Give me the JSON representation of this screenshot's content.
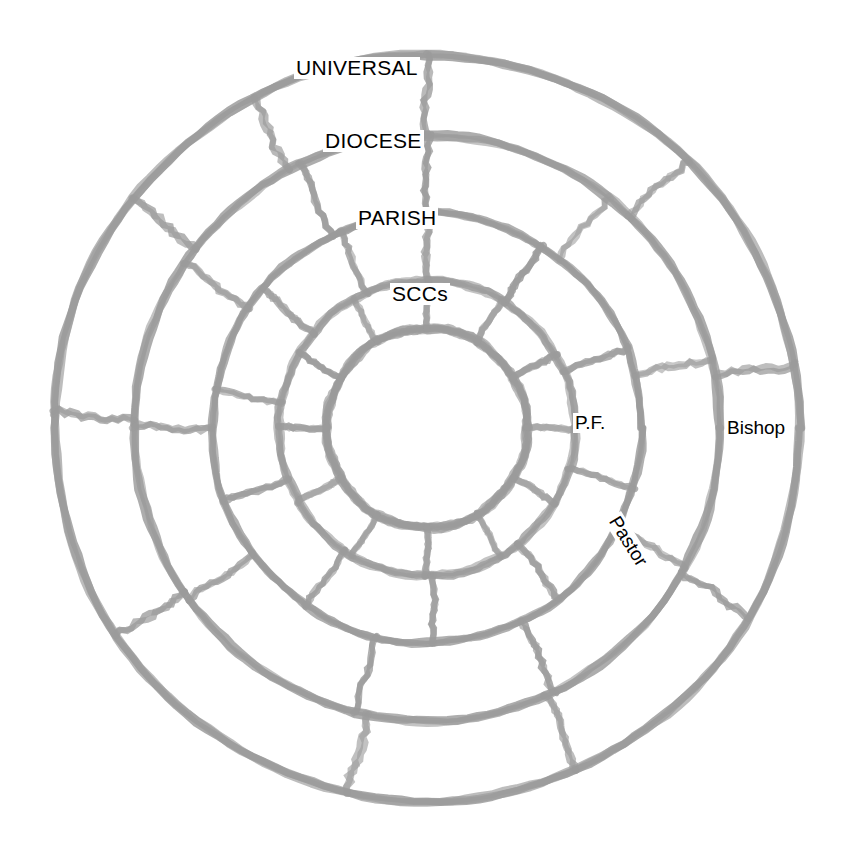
{
  "diagram": {
    "type": "concentric-ring-diagram",
    "center": {
      "x": 427,
      "y": 428
    },
    "stroke_color": "#9b9b9b",
    "text_color": "#000000",
    "background_color": "#ffffff",
    "rings": [
      {
        "id": "universal",
        "label": "UNIVERSAL",
        "level": 1,
        "outer_radius": 373,
        "inner_radius": 293,
        "segment_count": 10,
        "spoke_angles_deg": [
          90,
          46,
          10,
          330,
          294,
          258,
          214,
          178,
          142,
          118
        ]
      },
      {
        "id": "diocese",
        "label": "DIOCESE",
        "level": 2,
        "outer_radius": 293,
        "inner_radius": 215,
        "segment_count": 10,
        "spoke_angles_deg": [
          90,
          52,
          14,
          332,
          296,
          256,
          216,
          180,
          146,
          116
        ]
      },
      {
        "id": "parish",
        "label": "PARISH",
        "level": 3,
        "outer_radius": 215,
        "inner_radius": 148,
        "segment_count": 11,
        "spoke_angles_deg": [
          90,
          58,
          22,
          344,
          308,
          272,
          236,
          200,
          170,
          140,
          114
        ]
      },
      {
        "id": "sccs",
        "label": "SCCs",
        "level": 4,
        "outer_radius": 148,
        "inner_radius": 100,
        "segment_count": 12,
        "spoke_angles_deg": [
          90,
          60,
          30,
          0,
          330,
          300,
          270,
          240,
          210,
          180,
          150,
          120
        ]
      }
    ],
    "center_circle": {
      "radius": 100,
      "filled": false
    },
    "role_labels": [
      {
        "id": "bishop",
        "label": "Bishop",
        "ring": "diocese",
        "angle_deg": 0
      },
      {
        "id": "pf",
        "label": "P.F.",
        "ring": "parish",
        "angle_deg": 2
      },
      {
        "id": "pastor",
        "label": "Pastor",
        "ring": "parish",
        "angle_deg": 318,
        "rotation_deg": 58
      }
    ]
  }
}
